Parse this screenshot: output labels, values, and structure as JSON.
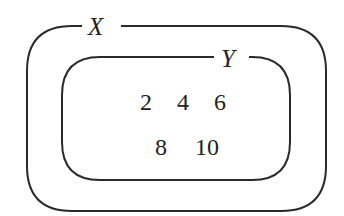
{
  "diagram": {
    "type": "venn-subset",
    "sets": [
      {
        "name": "X",
        "label": "X",
        "relation": "superset of Y"
      },
      {
        "name": "Y",
        "label": "Y",
        "relation": "subset of X"
      }
    ],
    "elements_in_Y": [
      "2",
      "4",
      "6",
      "8",
      "10"
    ],
    "rows": [
      [
        "2",
        "4",
        "6"
      ],
      [
        "8",
        "10"
      ]
    ],
    "stroke_color": "#2a2a2a",
    "background": "#ffffff"
  }
}
